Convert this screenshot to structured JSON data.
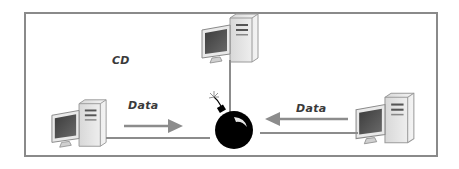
{
  "diagram": {
    "type": "network-topology",
    "frame_color": "#8a8a8a",
    "labels": {
      "network_label": "CD",
      "left_data_label": "Data",
      "right_data_label": "Data"
    },
    "nodes": [
      {
        "id": "top-computer",
        "kind": "desktop-computer"
      },
      {
        "id": "left-computer",
        "kind": "desktop-computer"
      },
      {
        "id": "right-computer",
        "kind": "desktop-computer"
      },
      {
        "id": "collision-point",
        "kind": "bomb-icon"
      }
    ],
    "edges": [
      {
        "from": "top-computer",
        "to": "collision-point",
        "style": "line"
      },
      {
        "from": "left-computer",
        "to": "collision-point",
        "style": "line"
      },
      {
        "from": "right-computer",
        "to": "collision-point",
        "style": "line"
      }
    ],
    "flows": [
      {
        "label": "Data",
        "direction": "left-to-center"
      },
      {
        "label": "Data",
        "direction": "right-to-center"
      }
    ],
    "colors": {
      "line": "#8c8c8c",
      "arrow": "#8c8c8c",
      "bomb": "#000000",
      "monitor_screen": "#4a4a4a",
      "case": "#e6e6e6"
    }
  }
}
